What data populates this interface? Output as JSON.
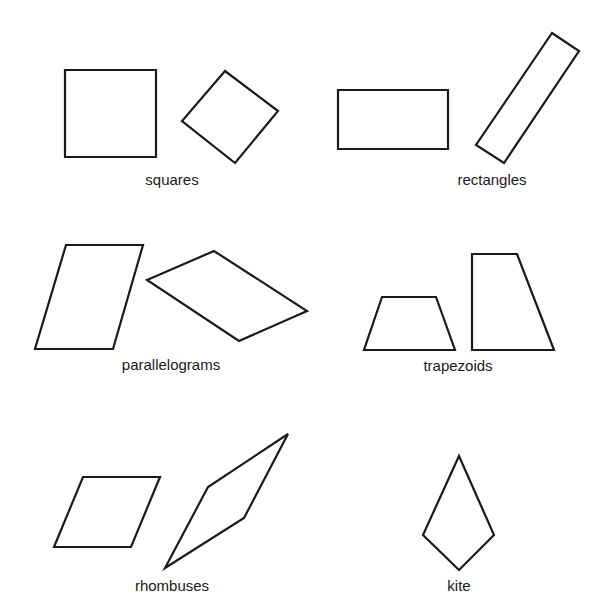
{
  "groups": [
    {
      "id": "squares",
      "label": "squares",
      "label_pos": [
        172,
        185
      ],
      "shapes": [
        {
          "name": "square-axis-aligned",
          "points": "65,70 156,70 156,157 65,157"
        },
        {
          "name": "square-rotated",
          "points": "225,71 278,111 235,163 182,121"
        }
      ]
    },
    {
      "id": "rectangles",
      "label": "rectangles",
      "label_pos": [
        492,
        185
      ],
      "shapes": [
        {
          "name": "rectangle-axis-aligned",
          "points": "338,90 448,90 448,149 338,149"
        },
        {
          "name": "rectangle-rotated",
          "points": "552,33 579,51 504,163 476,145"
        }
      ]
    },
    {
      "id": "parallelograms",
      "label": "parallelograms",
      "label_pos": [
        171,
        370
      ],
      "shapes": [
        {
          "name": "parallelogram-tall",
          "points": "66,245 143,245 113,349 35,349"
        },
        {
          "name": "parallelogram-tilted",
          "points": "147,280 214,251 307,311 239,341"
        }
      ]
    },
    {
      "id": "trapezoids",
      "label": "trapezoids",
      "label_pos": [
        458,
        371
      ],
      "shapes": [
        {
          "name": "trapezoid-isosceles",
          "points": "382,297 436,297 455,350 364,350"
        },
        {
          "name": "trapezoid-right",
          "points": "472,254 517,254 554,350 472,350"
        }
      ]
    },
    {
      "id": "rhombuses",
      "label": "rhombuses",
      "label_pos": [
        172,
        591
      ],
      "shapes": [
        {
          "name": "rhombus-wide",
          "points": "83,477 160,477 131,547 54,547"
        },
        {
          "name": "rhombus-narrow",
          "points": "288,434 244,518 165,568 208,487"
        }
      ]
    },
    {
      "id": "kite",
      "label": "kite",
      "label_pos": [
        459,
        591
      ],
      "shapes": [
        {
          "name": "kite",
          "points": "459,456 494,535 459,570 423,535"
        }
      ]
    }
  ]
}
